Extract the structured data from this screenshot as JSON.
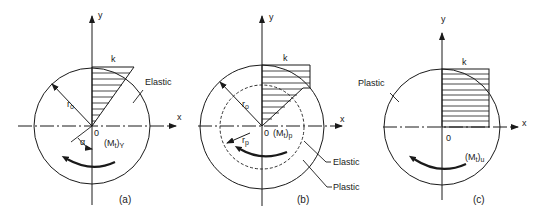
{
  "figure": {
    "panels": [
      {
        "id": "a",
        "caption": "(a)",
        "state_label": "Elastic",
        "shear_label": "k",
        "radius_label": "r",
        "radius_sub": "o",
        "origin_label": "0",
        "angle_label": "α",
        "moment_label": "(M",
        "moment_sub_t": "t",
        "moment_tail": ")",
        "moment_sub": "Y",
        "x_label": "x",
        "y_label": "y"
      },
      {
        "id": "b",
        "caption": "(b)",
        "shear_label": "k",
        "radius_outer_label": "r",
        "radius_outer_sub": "o",
        "radius_plastic_label": "r",
        "radius_plastic_sub": "p",
        "origin_label": "0",
        "moment_label": "(M",
        "moment_sub_t": "t",
        "moment_tail": ")",
        "moment_sub": "p",
        "elastic_label": "Elastic",
        "plastic_label": "Plastic",
        "x_label": "x",
        "y_label": "y"
      },
      {
        "id": "c",
        "caption": "(c)",
        "state_label": "Plastic",
        "shear_label": "k",
        "origin_label": "0",
        "moment_label": "(M",
        "moment_sub_t": "t",
        "moment_tail": ")",
        "moment_sub": "u",
        "x_label": "x",
        "y_label": "y"
      }
    ]
  }
}
